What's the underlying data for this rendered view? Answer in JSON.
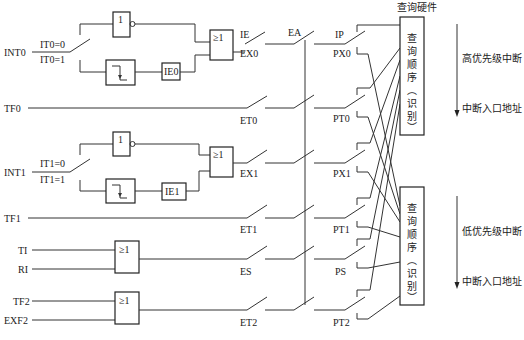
{
  "inputs": {
    "int0": "INT0",
    "it0_0": "IT0=0",
    "it0_1": "IT0=1",
    "tf0": "TF0",
    "int1": "INT1",
    "it1_0": "IT1=0",
    "it1_1": "IT1=1",
    "tf1": "TF1",
    "ti": "TI",
    "ri": "RI",
    "tf2": "TF2",
    "exf2": "EXF2"
  },
  "gates": {
    "not_symbol": "1",
    "or_symbol": "≥1",
    "ie0": "IE0",
    "ie1": "IE1"
  },
  "enable_switches": {
    "ie": "IE",
    "ex0": "EX0",
    "et0": "ET0",
    "ex1": "EX1",
    "et1": "ET1",
    "es": "ES",
    "et2": "ET2",
    "ea": "EA"
  },
  "priority_switches": {
    "ip": "IP",
    "px0": "PX0",
    "pt0": "PT0",
    "px1": "PX1",
    "pt1": "PT1",
    "ps": "PS",
    "pt2": "PT2"
  },
  "query": {
    "hardware_title": "查询硬件",
    "high_box": [
      "查",
      "询",
      "顺",
      "序",
      "︵",
      "识",
      "别",
      "︶"
    ],
    "low_box": [
      "查",
      "询",
      "顺",
      "序",
      "︵",
      "识",
      "别",
      "︶"
    ],
    "high_priority_label": "高优先级中断",
    "low_priority_label": "低优先级中断",
    "vector_label_high": "中断入口地址",
    "vector_label_low": "中断入口地址"
  }
}
